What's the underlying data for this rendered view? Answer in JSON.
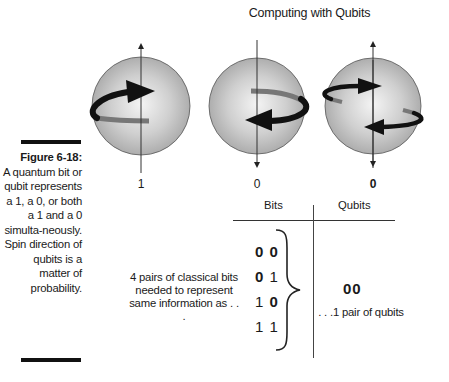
{
  "figure": {
    "title": "Computing with Qubits",
    "caption": {
      "label": "Figure 6-18:",
      "text": "A quantum bit or qubit represents a 1, a 0, or both a 1 and a 0 simulta-neously. Spin direction of qubits is a matter of probability."
    },
    "spheres": [
      {
        "state_label": "1",
        "axis_arrow": "up",
        "spin": "counterclockwise-front-right"
      },
      {
        "state_label": "0",
        "axis_arrow": "down",
        "spin": "clockwise-front-left"
      },
      {
        "state_label": "0",
        "axis_arrow": "both",
        "spin": "superposition"
      }
    ],
    "table": {
      "headers": [
        "Bits",
        "Qubits"
      ],
      "bits": [
        "00",
        "01",
        "10",
        "11"
      ],
      "left_note": "4 pairs of classical bits needed to represent same information as . . .",
      "qubit_value": "00",
      "right_note": ". . .1 pair of qubits"
    },
    "colors": {
      "sphere_light": "#f2f2f2",
      "sphere_dark": "#a8a8a8",
      "arrow_front": "#111111",
      "arrow_back": "#7a7a7a",
      "rule": "#111111"
    }
  }
}
